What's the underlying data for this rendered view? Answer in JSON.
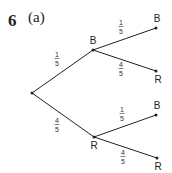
{
  "question": {
    "number": "6",
    "part": "(a)"
  },
  "tree": {
    "root": {
      "x": 32,
      "y": 93
    },
    "level1": [
      {
        "id": "B",
        "label": "B",
        "x": 93,
        "y": 50,
        "prob": {
          "num": "1",
          "den": "5"
        },
        "label_pos": {
          "x": 93,
          "y": 44
        },
        "prob_pos": {
          "x": 57,
          "y": 60
        }
      },
      {
        "id": "R",
        "label": "R",
        "x": 94,
        "y": 137,
        "prob": {
          "num": "4",
          "den": "5"
        },
        "label_pos": {
          "x": 94,
          "y": 149
        },
        "prob_pos": {
          "x": 57,
          "y": 126
        }
      }
    ],
    "level2": [
      {
        "parent": "B",
        "label": "B",
        "x": 156,
        "y": 28,
        "prob": {
          "num": "1",
          "den": "5"
        },
        "label_pos": {
          "x": 157,
          "y": 22
        },
        "prob_pos": {
          "x": 121,
          "y": 28
        }
      },
      {
        "parent": "B",
        "label": "R",
        "x": 156,
        "y": 71,
        "prob": {
          "num": "4",
          "den": "5"
        },
        "label_pos": {
          "x": 158,
          "y": 83
        },
        "prob_pos": {
          "x": 121,
          "y": 70
        }
      },
      {
        "parent": "R",
        "label": "B",
        "x": 156,
        "y": 115,
        "prob": {
          "num": "1",
          "den": "5"
        },
        "label_pos": {
          "x": 157,
          "y": 109
        },
        "prob_pos": {
          "x": 122,
          "y": 115
        }
      },
      {
        "parent": "R",
        "label": "R",
        "x": 157,
        "y": 158,
        "prob": {
          "num": "4",
          "den": "5"
        },
        "label_pos": {
          "x": 158,
          "y": 170
        },
        "prob_pos": {
          "x": 123,
          "y": 158
        }
      }
    ]
  },
  "colors": {
    "line": "#222222",
    "text": "#222222"
  }
}
